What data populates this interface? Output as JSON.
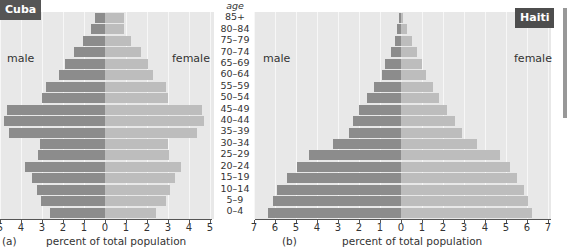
{
  "chart_data": [
    {
      "type": "bar",
      "subtype": "population-pyramid",
      "title": "Cuba",
      "panel_label": "(a)",
      "xlabel": "percent of total population",
      "ylabel": "age",
      "left_label": "male",
      "right_label": "female",
      "xlim": [
        -5,
        5
      ],
      "xticks": [
        "5",
        "4",
        "3",
        "2",
        "1",
        "0",
        "1",
        "2",
        "3",
        "4",
        "5"
      ],
      "categories": [
        "85+",
        "80-84",
        "75-79",
        "70-74",
        "65-69",
        "60-64",
        "55-59",
        "50-54",
        "45-49",
        "40-44",
        "35-39",
        "30-34",
        "25-29",
        "20-24",
        "15-19",
        "10-14",
        "5-9",
        "0-4"
      ],
      "series": [
        {
          "name": "male",
          "values": [
            0.5,
            0.65,
            1.05,
            1.5,
            1.9,
            2.2,
            2.8,
            3.0,
            4.65,
            4.8,
            4.55,
            3.1,
            3.2,
            3.8,
            3.5,
            3.25,
            3.05,
            2.6
          ]
        },
        {
          "name": "female",
          "values": [
            0.9,
            0.9,
            1.25,
            1.7,
            2.05,
            2.3,
            2.9,
            3.0,
            4.6,
            4.7,
            4.4,
            3.0,
            3.05,
            3.6,
            3.35,
            3.1,
            2.9,
            2.45
          ]
        }
      ],
      "grid": true
    },
    {
      "type": "bar",
      "subtype": "population-pyramid",
      "title": "Haiti",
      "panel_label": "(b)",
      "xlabel": "percent of total population",
      "ylabel": "age",
      "left_label": "male",
      "right_label": "female",
      "xlim": [
        -7,
        7
      ],
      "xticks": [
        "7",
        "6",
        "5",
        "4",
        "3",
        "2",
        "1",
        "0",
        "1",
        "2",
        "3",
        "4",
        "5",
        "6",
        "7"
      ],
      "categories": [
        "85+",
        "80-84",
        "75-79",
        "70-74",
        "65-69",
        "60-64",
        "55-59",
        "50-54",
        "45-49",
        "40-44",
        "35-39",
        "30-34",
        "25-29",
        "20-24",
        "15-19",
        "10-14",
        "5-9",
        "0-4"
      ],
      "series": [
        {
          "name": "male",
          "values": [
            0.1,
            0.2,
            0.3,
            0.5,
            0.75,
            0.9,
            1.3,
            1.6,
            2.0,
            2.3,
            2.5,
            3.25,
            4.4,
            4.95,
            5.45,
            5.9,
            6.1,
            6.35
          ]
        },
        {
          "name": "female",
          "values": [
            0.1,
            0.3,
            0.5,
            0.75,
            1.0,
            1.2,
            1.5,
            1.8,
            2.2,
            2.55,
            2.9,
            3.6,
            4.7,
            5.2,
            5.5,
            5.85,
            6.05,
            6.25
          ]
        }
      ],
      "grid": true
    }
  ],
  "labels": {
    "age_header": "age",
    "ages": [
      "85+",
      "80–84",
      "75–79",
      "70–74",
      "65–69",
      "60–64",
      "55–59",
      "50–54",
      "45–49",
      "40–44",
      "35–39",
      "30–34",
      "25–29",
      "20–24",
      "15–19",
      "10–14",
      "5–9",
      "0–4"
    ],
    "cuba_badge": "Cuba",
    "haiti_badge": "Haiti",
    "male": "male",
    "female": "female",
    "caption_a": "(a)",
    "caption_b": "(b)",
    "xlabel": "percent of total population"
  },
  "colors": {
    "male_bar": "#8c8c8c",
    "female_bar": "#bdbdbd",
    "panel_bg": "#e8e8e8",
    "badge_bg": "#555555"
  }
}
